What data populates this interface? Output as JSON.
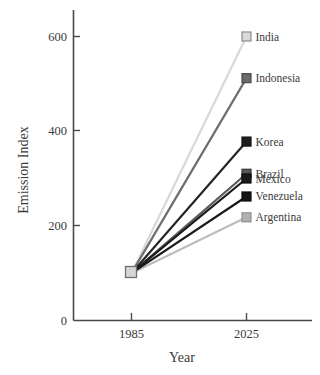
{
  "chart_data": {
    "type": "line",
    "title": "",
    "xlabel": "Year",
    "ylabel": "Emission Index",
    "x": [
      1985,
      2025
    ],
    "x_tick_labels": [
      "1985",
      "2025"
    ],
    "y_ticks": [
      0,
      200,
      400,
      600
    ],
    "y_tick_labels": [
      "0",
      "200",
      "400",
      "600"
    ],
    "ylim": [
      0,
      640
    ],
    "grid": false,
    "legend_position": "right-inline-at-line-ends",
    "series": [
      {
        "name": "India",
        "values": [
          100,
          600
        ],
        "color": "#d8d8d8",
        "marker_fill": "#d9d9d9",
        "marker_edge": "#8a8a8a"
      },
      {
        "name": "Indonesia",
        "values": [
          100,
          512
        ],
        "color": "#6e6e6e",
        "marker_fill": "#6b6b6b",
        "marker_edge": "#4a4a4a"
      },
      {
        "name": "Korea",
        "values": [
          100,
          378
        ],
        "color": "#262626",
        "marker_fill": "#1f1f1f",
        "marker_edge": "#111111"
      },
      {
        "name": "Brazil",
        "values": [
          100,
          310
        ],
        "color": "#5a5a5a",
        "marker_fill": "#565656",
        "marker_edge": "#3a3a3a"
      },
      {
        "name": "Mexico",
        "values": [
          100,
          300
        ],
        "color": "#1a1a1a",
        "marker_fill": "#1a1a1a",
        "marker_edge": "#0d0d0d"
      },
      {
        "name": "Venezuela",
        "values": [
          100,
          262
        ],
        "color": "#1a1a1a",
        "marker_fill": "#151515",
        "marker_edge": "#0a0a0a"
      },
      {
        "name": "Argentina",
        "values": [
          100,
          218
        ],
        "color": "#bdbdbd",
        "marker_fill": "#b0b0b0",
        "marker_edge": "#8f8f8f"
      }
    ],
    "origin_marker": {
      "fill": "#d6d6d6",
      "edge": "#6f6f6f",
      "value": 100
    },
    "axis_color": "#4a4a4a"
  },
  "legend": {
    "entries": [
      {
        "label": "India"
      },
      {
        "label": "Indonesia"
      },
      {
        "label": "Korea"
      },
      {
        "label": "Brazil"
      },
      {
        "label": "Mexico"
      },
      {
        "label": "Venezuela"
      },
      {
        "label": "Argentina"
      }
    ]
  },
  "axes": {
    "y_title": "Emission Index",
    "x_title": "Year",
    "y_labels": [
      "600",
      "400",
      "200",
      "0"
    ],
    "x_labels": [
      "1985",
      "2025"
    ]
  }
}
